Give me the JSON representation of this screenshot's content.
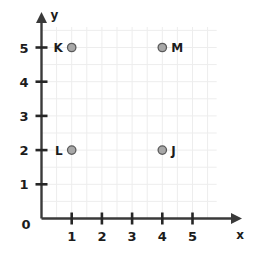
{
  "chart_data": {
    "type": "scatter",
    "title": "",
    "xlabel": "x",
    "ylabel": "y",
    "xlim": [
      0,
      5.8
    ],
    "ylim": [
      0,
      5.6
    ],
    "grid": true,
    "legend": "none",
    "origin_label": "0",
    "xticks": [
      1,
      2,
      3,
      4,
      5
    ],
    "xtick_labels": [
      "1",
      "2",
      "3",
      "4",
      "5"
    ],
    "yticks": [
      1,
      2,
      3,
      4,
      5
    ],
    "ytick_labels": [
      "1",
      "2",
      "3",
      "4",
      "5"
    ],
    "points": [
      {
        "label": "K",
        "x": 1,
        "y": 5,
        "label_side": "left"
      },
      {
        "label": "M",
        "x": 4,
        "y": 5,
        "label_side": "right"
      },
      {
        "label": "L",
        "x": 1,
        "y": 2,
        "label_side": "left"
      },
      {
        "label": "J",
        "x": 4,
        "y": 2,
        "label_side": "right"
      }
    ],
    "colors": {
      "background": "#ffffff",
      "grid": "#ededed",
      "axis": "#3a3a3a",
      "tick": "#262626",
      "text": "#1c1c1c",
      "point_fill": "#a8a8a8",
      "point_stroke": "#5a5a5a"
    }
  }
}
